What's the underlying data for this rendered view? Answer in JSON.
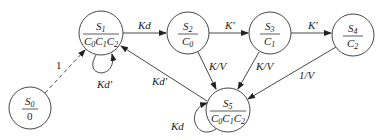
{
  "diagram": {
    "type": "state-transition",
    "states": [
      {
        "id": "S0",
        "name": "S",
        "sub": "0",
        "output": "0",
        "cx": 30,
        "cy": 108,
        "r": 21
      },
      {
        "id": "S1",
        "name": "S",
        "sub": "1",
        "output": "C0C1C2",
        "cx": 101,
        "cy": 33,
        "r": 22
      },
      {
        "id": "S2",
        "name": "S",
        "sub": "2",
        "output": "C0",
        "cx": 188,
        "cy": 33,
        "r": 21
      },
      {
        "id": "S3",
        "name": "S",
        "sub": "3",
        "output": "C1",
        "cx": 270,
        "cy": 33,
        "r": 21
      },
      {
        "id": "S4",
        "name": "S",
        "sub": "4",
        "output": "C2",
        "cx": 353,
        "cy": 35,
        "r": 21
      },
      {
        "id": "S5",
        "name": "S",
        "sub": "5",
        "output": "C0C1C2",
        "cx": 228,
        "cy": 110,
        "r": 22
      }
    ],
    "transitions": [
      {
        "from": "S0",
        "to": "S1",
        "label": "1",
        "style": "dashed"
      },
      {
        "from": "S1",
        "to": "S1",
        "label": "Kd'"
      },
      {
        "from": "S1",
        "to": "S2",
        "label": "Kd"
      },
      {
        "from": "S2",
        "to": "S3",
        "label": "K'"
      },
      {
        "from": "S3",
        "to": "S4",
        "label": "K'"
      },
      {
        "from": "S2",
        "to": "S5",
        "label": "K/V"
      },
      {
        "from": "S3",
        "to": "S5",
        "label": "K/V"
      },
      {
        "from": "S4",
        "to": "S5",
        "label": "1/V"
      },
      {
        "from": "S5",
        "to": "S1",
        "label": "Kd'"
      },
      {
        "from": "S5",
        "to": "S5",
        "label": "Kd"
      }
    ]
  },
  "labels": {
    "s0_out": "0",
    "s1_out": "C0C1C2",
    "s2_out": "C0",
    "s3_out": "C1",
    "s4_out": "C2",
    "s5_out": "C0C1C2",
    "e_s0_s1": "1",
    "e_s1_self": "Kd'",
    "e_s1_s2": "Kd",
    "e_s2_s3": "K'",
    "e_s3_s4": "K'",
    "e_s2_s5": "K/V",
    "e_s3_s5": "K/V",
    "e_s4_s5": "1/V",
    "e_s5_s1": "Kd'",
    "e_s5_self": "Kd"
  }
}
